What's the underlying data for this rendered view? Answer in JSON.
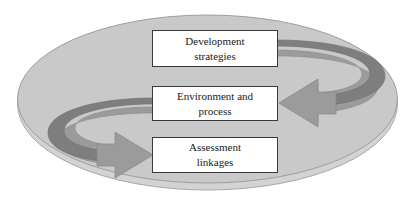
{
  "diagram": {
    "type": "cycle-diagram",
    "shape": "ellipse",
    "colors": {
      "ellipse_fill": "#c9c9c9",
      "ellipse_rim": "#dcdcdc",
      "ellipse_stroke": "#9a9a9a",
      "ribbon_band": "#7e7e7e",
      "ribbon_face": "#9b9b9b",
      "arrow_head": "#9b9b9b",
      "box_fill": "#ffffff",
      "box_border": "#3a3a3a",
      "text": "#1a1a1a",
      "background": "#ffffff"
    },
    "boxes": [
      {
        "id": "development",
        "line1": "Development",
        "line2": "strategies"
      },
      {
        "id": "environment",
        "line1": "Environment and",
        "line2": "process"
      },
      {
        "id": "assessment",
        "line1": "Assessment",
        "line2": "linkages"
      }
    ],
    "arrows": [
      {
        "id": "right-loop",
        "from": "Development strategies",
        "to": "Environment and process",
        "direction": "clockwise-right",
        "points": "left"
      },
      {
        "id": "left-loop",
        "from": "Environment and process",
        "to": "Assessment linkages",
        "direction": "counterclockwise-left",
        "points": "right"
      }
    ]
  }
}
